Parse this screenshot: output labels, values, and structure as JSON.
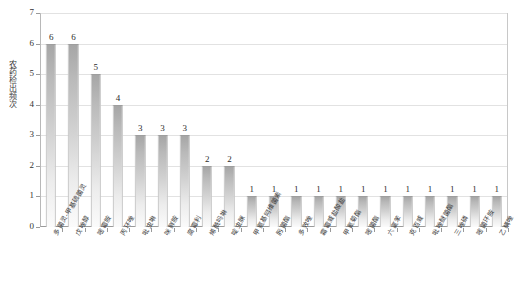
{
  "chart_data": {
    "type": "bar",
    "title": "",
    "xlabel": "",
    "ylabel": "农药检出频次",
    "ylim": [
      0,
      7
    ],
    "ytick_labels": [
      "0",
      "1",
      "2",
      "3",
      "4",
      "5",
      "6",
      "7"
    ],
    "grid": true,
    "legend": null,
    "bar_color": "#b9b9b9",
    "bar_color_top": "#a6a6a6",
    "bar_color_bottom": "#fbfbfb",
    "categories": [
      "多菌灵-甲基硫菌灵",
      "戊唑醇",
      "嘧霉胺",
      "丙环唑",
      "吡虫啉",
      "咪鲜胺",
      "腐霉利",
      "烯酰吗啉",
      "啶虫脒",
      "甲氨基阿维菌素",
      "肟菌酯",
      "多效唑",
      "霜霉威盐酸盐",
      "甲氰菊酯",
      "嘧菌酯",
      "六氯苯",
      "克百威",
      "吡唑醚菌酯",
      "三唑磷",
      "嘧菌环胺",
      "乙螨唑"
    ],
    "values": [
      6,
      6,
      5,
      4,
      3,
      3,
      3,
      2,
      2,
      1,
      1,
      1,
      1,
      1,
      1,
      1,
      1,
      1,
      1,
      1,
      1
    ],
    "value_labels": [
      "6",
      "6",
      "5",
      "4",
      "3",
      "3",
      "3",
      "2",
      "2",
      "1",
      "1",
      "1",
      "1",
      "1",
      "1",
      "1",
      "1",
      "1",
      "1",
      "1",
      "1"
    ]
  }
}
